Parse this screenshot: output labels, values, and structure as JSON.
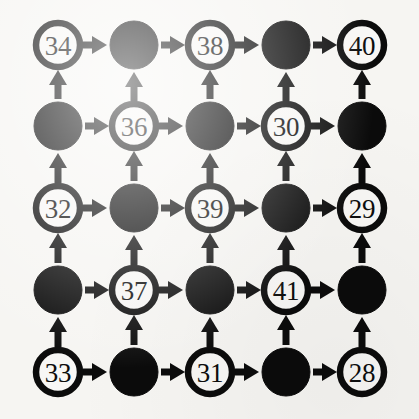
{
  "figure": {
    "type": "diagram",
    "background_color": "#f6f5f2",
    "ink_color": "#0b0b0b",
    "node_fill_white": "#f8f7f5",
    "node_fill_black": "#0b0b0b"
  },
  "grid": {
    "rows": 5,
    "cols": 5,
    "col_centers_px": [
      58,
      134,
      210,
      286,
      362
    ],
    "row_centers_px": [
      45,
      126,
      208,
      290,
      372
    ],
    "white_node_radius_px": 22,
    "black_node_radius_px": 24
  },
  "nodes": [
    {
      "id": "r0c0",
      "row": 0,
      "col": 0,
      "kind": "white",
      "label": "34"
    },
    {
      "id": "r0c1",
      "row": 0,
      "col": 1,
      "kind": "black",
      "label": ""
    },
    {
      "id": "r0c2",
      "row": 0,
      "col": 2,
      "kind": "white",
      "label": "38"
    },
    {
      "id": "r0c3",
      "row": 0,
      "col": 3,
      "kind": "black",
      "label": ""
    },
    {
      "id": "r0c4",
      "row": 0,
      "col": 4,
      "kind": "white",
      "label": "40"
    },
    {
      "id": "r1c0",
      "row": 1,
      "col": 0,
      "kind": "black",
      "label": ""
    },
    {
      "id": "r1c1",
      "row": 1,
      "col": 1,
      "kind": "white",
      "label": "36"
    },
    {
      "id": "r1c2",
      "row": 1,
      "col": 2,
      "kind": "black",
      "label": ""
    },
    {
      "id": "r1c3",
      "row": 1,
      "col": 3,
      "kind": "white",
      "label": "30"
    },
    {
      "id": "r1c4",
      "row": 1,
      "col": 4,
      "kind": "black",
      "label": ""
    },
    {
      "id": "r2c0",
      "row": 2,
      "col": 0,
      "kind": "white",
      "label": "32"
    },
    {
      "id": "r2c1",
      "row": 2,
      "col": 1,
      "kind": "black",
      "label": ""
    },
    {
      "id": "r2c2",
      "row": 2,
      "col": 2,
      "kind": "white",
      "label": "39"
    },
    {
      "id": "r2c3",
      "row": 2,
      "col": 3,
      "kind": "black",
      "label": ""
    },
    {
      "id": "r2c4",
      "row": 2,
      "col": 4,
      "kind": "white",
      "label": "29"
    },
    {
      "id": "r3c0",
      "row": 3,
      "col": 0,
      "kind": "black",
      "label": ""
    },
    {
      "id": "r3c1",
      "row": 3,
      "col": 1,
      "kind": "white",
      "label": "37"
    },
    {
      "id": "r3c2",
      "row": 3,
      "col": 2,
      "kind": "black",
      "label": ""
    },
    {
      "id": "r3c3",
      "row": 3,
      "col": 3,
      "kind": "white",
      "label": "41"
    },
    {
      "id": "r3c4",
      "row": 3,
      "col": 4,
      "kind": "black",
      "label": ""
    },
    {
      "id": "r4c0",
      "row": 4,
      "col": 0,
      "kind": "white",
      "label": "33"
    },
    {
      "id": "r4c1",
      "row": 4,
      "col": 1,
      "kind": "black",
      "label": ""
    },
    {
      "id": "r4c2",
      "row": 4,
      "col": 2,
      "kind": "white",
      "label": "31"
    },
    {
      "id": "r4c3",
      "row": 4,
      "col": 3,
      "kind": "black",
      "label": ""
    },
    {
      "id": "r4c4",
      "row": 4,
      "col": 4,
      "kind": "white",
      "label": "28"
    }
  ],
  "edges": [
    {
      "from": "r0c0",
      "to": "r0c1",
      "direction": "right"
    },
    {
      "from": "r0c1",
      "to": "r0c2",
      "direction": "right"
    },
    {
      "from": "r0c2",
      "to": "r0c3",
      "direction": "right"
    },
    {
      "from": "r0c3",
      "to": "r0c4",
      "direction": "right"
    },
    {
      "from": "r1c0",
      "to": "r1c1",
      "direction": "right"
    },
    {
      "from": "r1c1",
      "to": "r1c2",
      "direction": "right"
    },
    {
      "from": "r1c2",
      "to": "r1c3",
      "direction": "right"
    },
    {
      "from": "r1c3",
      "to": "r1c4",
      "direction": "right"
    },
    {
      "from": "r2c0",
      "to": "r2c1",
      "direction": "right"
    },
    {
      "from": "r2c1",
      "to": "r2c2",
      "direction": "right"
    },
    {
      "from": "r2c2",
      "to": "r2c3",
      "direction": "right"
    },
    {
      "from": "r2c3",
      "to": "r2c4",
      "direction": "right"
    },
    {
      "from": "r3c0",
      "to": "r3c1",
      "direction": "right"
    },
    {
      "from": "r3c1",
      "to": "r3c2",
      "direction": "right"
    },
    {
      "from": "r3c2",
      "to": "r3c3",
      "direction": "right"
    },
    {
      "from": "r3c3",
      "to": "r3c4",
      "direction": "right"
    },
    {
      "from": "r4c0",
      "to": "r4c1",
      "direction": "right"
    },
    {
      "from": "r4c1",
      "to": "r4c2",
      "direction": "right"
    },
    {
      "from": "r4c2",
      "to": "r4c3",
      "direction": "right"
    },
    {
      "from": "r4c3",
      "to": "r4c4",
      "direction": "right"
    },
    {
      "from": "r1c0",
      "to": "r0c0",
      "direction": "up"
    },
    {
      "from": "r1c1",
      "to": "r0c1",
      "direction": "up"
    },
    {
      "from": "r1c2",
      "to": "r0c2",
      "direction": "up"
    },
    {
      "from": "r1c3",
      "to": "r0c3",
      "direction": "up"
    },
    {
      "from": "r1c4",
      "to": "r0c4",
      "direction": "up"
    },
    {
      "from": "r2c0",
      "to": "r1c0",
      "direction": "up"
    },
    {
      "from": "r2c1",
      "to": "r1c1",
      "direction": "up"
    },
    {
      "from": "r2c2",
      "to": "r1c2",
      "direction": "up"
    },
    {
      "from": "r2c3",
      "to": "r1c3",
      "direction": "up"
    },
    {
      "from": "r2c4",
      "to": "r1c4",
      "direction": "up"
    },
    {
      "from": "r3c0",
      "to": "r2c0",
      "direction": "up"
    },
    {
      "from": "r3c1",
      "to": "r2c1",
      "direction": "up"
    },
    {
      "from": "r3c2",
      "to": "r2c2",
      "direction": "up"
    },
    {
      "from": "r3c3",
      "to": "r2c3",
      "direction": "up"
    },
    {
      "from": "r3c4",
      "to": "r2c4",
      "direction": "up"
    },
    {
      "from": "r4c0",
      "to": "r3c0",
      "direction": "up"
    },
    {
      "from": "r4c1",
      "to": "r3c1",
      "direction": "up"
    },
    {
      "from": "r4c2",
      "to": "r3c2",
      "direction": "up"
    },
    {
      "from": "r4c3",
      "to": "r3c3",
      "direction": "up"
    },
    {
      "from": "r4c4",
      "to": "r3c4",
      "direction": "up"
    }
  ]
}
